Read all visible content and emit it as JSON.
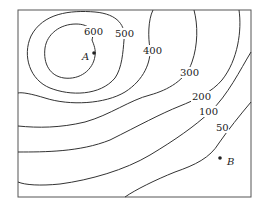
{
  "diagram": {
    "type": "contour-map",
    "contours": [
      {
        "level": "600",
        "label": "600"
      },
      {
        "level": "500",
        "label": "500"
      },
      {
        "level": "400",
        "label": "400"
      },
      {
        "level": "300",
        "label": "300"
      },
      {
        "level": "200",
        "label": "200"
      },
      {
        "level": "100",
        "label": "100"
      },
      {
        "level": "50",
        "label": "50"
      }
    ],
    "points": [
      {
        "name": "A",
        "label": "A"
      },
      {
        "name": "B",
        "label": "B"
      }
    ],
    "colors": {
      "line": "#333333",
      "background": "#ffffff"
    }
  }
}
